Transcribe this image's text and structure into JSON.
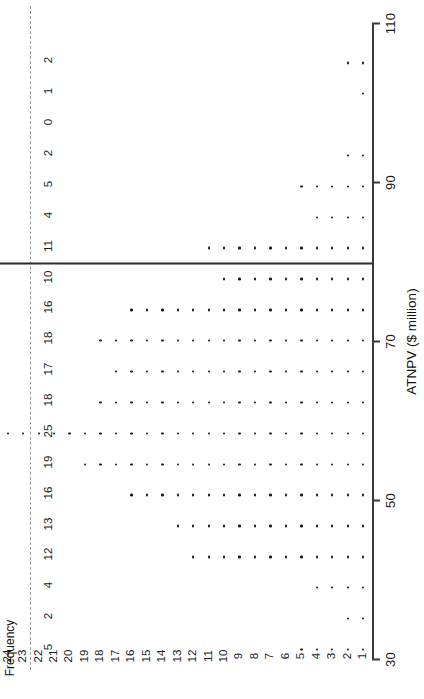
{
  "chart_data": {
    "type": "bar",
    "subtype": "horizontal-dot-plot",
    "title": "",
    "xlabel": "ATNPV ($ million)",
    "ylabel": "Frequency",
    "orientation": "rotated-90-ccw",
    "axis_ticks": [
      30,
      50,
      70,
      90,
      110
    ],
    "xlim": [
      30,
      110
    ],
    "grid": false,
    "legend": false,
    "dot_count_scale": [
      1,
      2,
      3,
      4,
      5,
      6,
      7,
      8,
      9,
      10,
      11,
      12,
      13,
      14,
      15,
      16,
      17,
      18,
      19,
      20,
      21,
      22,
      23,
      24,
      25
    ],
    "categories": [
      "b1",
      "b2",
      "b3",
      "b4",
      "b5",
      "b6",
      "b7",
      "b8",
      "b9",
      "b10",
      "b11",
      "b12",
      "b13",
      "b14",
      "b15",
      "b16",
      "b17",
      "b18",
      "b19",
      "b20"
    ],
    "values": [
      5,
      2,
      4,
      12,
      13,
      16,
      19,
      25,
      18,
      17,
      18,
      16,
      10,
      11,
      4,
      5,
      2,
      0,
      1,
      2
    ],
    "frequency_labels_top_to_bottom": [
      2,
      1,
      0,
      2,
      5,
      4,
      11,
      10,
      16,
      18,
      17,
      18,
      25,
      19,
      16,
      13,
      12,
      4,
      2,
      5
    ],
    "median_line": {
      "present": true,
      "after_row_index": 12,
      "label": ""
    }
  },
  "axis": {
    "title": "ATNPV ($ million)",
    "tick_labels": [
      "30",
      "50",
      "70",
      "90",
      "110"
    ]
  },
  "frequency_axis": {
    "caption": "Frequency",
    "labels": [
      "2",
      "1",
      "0",
      "2",
      "5",
      "4",
      "11",
      "10",
      "16",
      "18",
      "17",
      "18",
      "25",
      "19",
      "16",
      "13",
      "12",
      "4",
      "2",
      "5"
    ]
  },
  "count_scale": {
    "labels": [
      "25",
      "24",
      "23",
      "22",
      "21",
      "20",
      "19",
      "18",
      "17",
      "16",
      "15",
      "14",
      "13",
      "12",
      "11",
      "10",
      "9",
      "8",
      "7",
      "6",
      "5",
      "4",
      "3",
      "2",
      "1"
    ]
  },
  "colors": {
    "dot": "#1b1b1b",
    "axis": "#3a3a3a",
    "median": "#2b2b2b",
    "background": "#ffffff"
  }
}
